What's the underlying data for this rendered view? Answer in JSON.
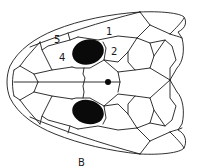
{
  "figure": {
    "panel_label": "B",
    "labels": [
      {
        "id": "1",
        "text": "1",
        "x": 106,
        "y": 35
      },
      {
        "id": "2",
        "text": "2",
        "x": 111,
        "y": 55
      },
      {
        "id": "4",
        "text": "4",
        "x": 59,
        "y": 61
      },
      {
        "id": "5",
        "text": "5",
        "x": 54,
        "y": 43
      }
    ],
    "colors": {
      "line": "#1a1a1a",
      "fill_dark": "#0a0a0a",
      "background": "#ffffff"
    }
  }
}
